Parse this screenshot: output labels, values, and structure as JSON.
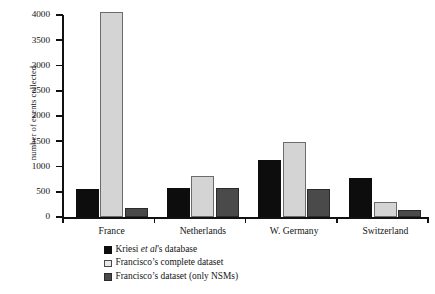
{
  "chart_data": {
    "type": "bar",
    "title": "",
    "xlabel": "",
    "ylabel": "number of events collected",
    "categories": [
      "France",
      "Netherlands",
      "W. Germany",
      "Switzerland"
    ],
    "series": [
      {
        "name": "Kriesi et al's database",
        "values": [
          550,
          580,
          1120,
          780
        ],
        "color": "#0d0d0d"
      },
      {
        "name": "Francisco's complete dataset",
        "values": [
          4050,
          820,
          1480,
          290
        ],
        "color": "#d4d4d4"
      },
      {
        "name": "Francisco's dataset (only NSMs)",
        "values": [
          180,
          580,
          550,
          130
        ],
        "color": "#4a4a4a"
      }
    ],
    "ylim": [
      0,
      4000
    ],
    "ytick_values": [
      0,
      500,
      1000,
      1500,
      2000,
      2500,
      3000,
      3500,
      4000
    ],
    "ytick_labels": [
      "0",
      "500",
      "1000",
      "1500",
      "2000",
      "2500",
      "3000",
      "3500",
      "4000"
    ],
    "grid": false,
    "legend_position": "below-center",
    "legend_entries": [
      {
        "prefix": "Kriesi ",
        "italic": "et al",
        "suffix": "'s database",
        "swatch": "black"
      },
      {
        "prefix": "Francisco’s complete dataset",
        "italic": "",
        "suffix": "",
        "swatch": "light-gray"
      },
      {
        "prefix": "Francisco’s dataset (only NSMs)",
        "italic": "",
        "suffix": "",
        "swatch": "dark-gray"
      }
    ]
  }
}
